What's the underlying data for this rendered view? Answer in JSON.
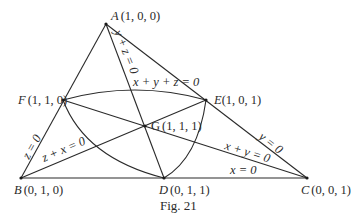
{
  "figure": {
    "caption": "Fig. 21",
    "points": {
      "A": {
        "name": "A",
        "coords": "(1, 0, 0)"
      },
      "B": {
        "name": "B",
        "coords": "(0, 1, 0)"
      },
      "C": {
        "name": "C",
        "coords": "(0, 0, 1)"
      },
      "D": {
        "name": "D",
        "coords": "(0, 1, 1)"
      },
      "E": {
        "name": "E",
        "coords": "(1, 0, 1)"
      },
      "F": {
        "name": "F",
        "coords": "(1, 1, 0)"
      },
      "G": {
        "name": "G",
        "coords": "(1, 1, 1)"
      }
    },
    "line_labels": {
      "AB": "z = 0",
      "AC": "y = 0",
      "BC": "x = 0",
      "AD": "y + z = 0",
      "BE": "z + x = 0",
      "CF": "x + y = 0",
      "conic": "x + y + z = 0"
    }
  }
}
